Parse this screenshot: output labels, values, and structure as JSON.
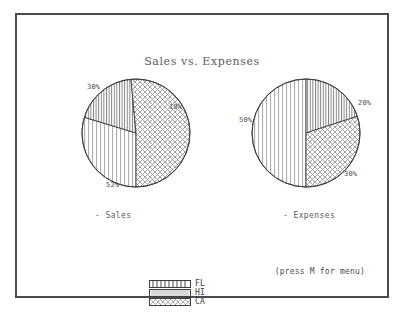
{
  "screen": {
    "title": "Sales vs. Expenses",
    "status_hint": "(press M for menu)",
    "frame_color": "#4a4a4f",
    "background_color": "#ffffff",
    "ink_color": "#4a4a50"
  },
  "legend": {
    "items": [
      {
        "label": "FL",
        "pattern": "vertical-lines-dense"
      },
      {
        "label": "HI",
        "pattern": "vertical-lines-fine"
      },
      {
        "label": "CA",
        "pattern": "crosshatch"
      }
    ]
  },
  "charts": {
    "left": {
      "caption": "- Sales"
    },
    "right": {
      "caption": "- Expenses"
    }
  },
  "chart_data": [
    {
      "type": "pie",
      "title": "Sales",
      "caption": "- Sales",
      "categories": [
        "HI",
        "FL",
        "CA"
      ],
      "values": [
        30,
        19,
        52
      ],
      "labels": [
        "30%",
        "19%",
        "52%"
      ],
      "patterns": [
        "vertical-lines-fine",
        "vertical-lines-dense",
        "crosshatch"
      ],
      "start_angle_deg": 180,
      "direction": "clockwise",
      "legend": [
        "FL",
        "HI",
        "CA"
      ],
      "legend_position": "bottom-center"
    },
    {
      "type": "pie",
      "title": "Expenses",
      "caption": "- Expenses",
      "categories": [
        "HI",
        "FL",
        "CA"
      ],
      "values": [
        50,
        20,
        30
      ],
      "labels": [
        "50%",
        "20%",
        "30%"
      ],
      "patterns": [
        "vertical-lines-fine",
        "vertical-lines-dense",
        "crosshatch"
      ],
      "start_angle_deg": 180,
      "direction": "clockwise",
      "legend": [
        "FL",
        "HI",
        "CA"
      ],
      "legend_position": "bottom-center"
    }
  ]
}
